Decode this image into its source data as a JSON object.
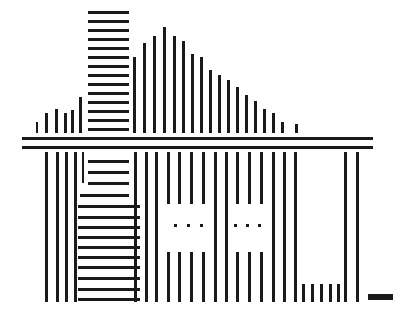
{
  "figure": {
    "width": 401,
    "height": 315,
    "background_color": "#ffffff",
    "ink_color": "#1a1a1a"
  },
  "chart_data": {
    "type": "bar",
    "xlabel": "",
    "ylabel": "",
    "grid": false,
    "legend": null,
    "groups": [
      {
        "name": "roof-left-slope",
        "orientation": "vertical",
        "description": "Ascending vertical bars forming the left roof slope",
        "bars": [
          {
            "x": 36,
            "y": 122,
            "w": 2,
            "h": 11
          },
          {
            "x": 45,
            "y": 113,
            "w": 3,
            "h": 20
          },
          {
            "x": 55,
            "y": 109,
            "w": 3,
            "h": 24
          },
          {
            "x": 64,
            "y": 113,
            "w": 3,
            "h": 20
          },
          {
            "x": 71,
            "y": 110,
            "w": 3,
            "h": 23
          },
          {
            "x": 79,
            "y": 97,
            "w": 3,
            "h": 36
          }
        ]
      },
      {
        "name": "chimney-block",
        "orientation": "horizontal",
        "description": "Stack of horizontal bars forming the chimney / upper-left mass",
        "bars": [
          {
            "x": 88,
            "y": 11,
            "w": 41,
            "h": 3
          },
          {
            "x": 88,
            "y": 20,
            "w": 41,
            "h": 3
          },
          {
            "x": 88,
            "y": 29,
            "w": 41,
            "h": 3
          },
          {
            "x": 88,
            "y": 38,
            "w": 41,
            "h": 3
          },
          {
            "x": 88,
            "y": 47,
            "w": 41,
            "h": 3
          },
          {
            "x": 88,
            "y": 56,
            "w": 41,
            "h": 3
          },
          {
            "x": 88,
            "y": 65,
            "w": 41,
            "h": 3
          },
          {
            "x": 88,
            "y": 74,
            "w": 41,
            "h": 3
          },
          {
            "x": 88,
            "y": 83,
            "w": 41,
            "h": 3
          },
          {
            "x": 88,
            "y": 92,
            "w": 41,
            "h": 3
          },
          {
            "x": 88,
            "y": 101,
            "w": 41,
            "h": 3
          },
          {
            "x": 88,
            "y": 110,
            "w": 41,
            "h": 3
          },
          {
            "x": 88,
            "y": 119,
            "w": 41,
            "h": 3
          },
          {
            "x": 88,
            "y": 128,
            "w": 41,
            "h": 3
          }
        ]
      },
      {
        "name": "roof-ridge-and-right-slope",
        "orientation": "vertical",
        "description": "Tall bars at the ridge descending to the right eave",
        "bars": [
          {
            "x": 133,
            "y": 57,
            "w": 3,
            "h": 76
          },
          {
            "x": 143,
            "y": 43,
            "w": 3,
            "h": 90
          },
          {
            "x": 153,
            "y": 36,
            "w": 3,
            "h": 97
          },
          {
            "x": 163,
            "y": 27,
            "w": 3,
            "h": 106
          },
          {
            "x": 173,
            "y": 36,
            "w": 3,
            "h": 97
          },
          {
            "x": 182,
            "y": 41,
            "w": 3,
            "h": 92
          },
          {
            "x": 191,
            "y": 54,
            "w": 3,
            "h": 79
          },
          {
            "x": 200,
            "y": 57,
            "w": 3,
            "h": 76
          },
          {
            "x": 209,
            "y": 70,
            "w": 3,
            "h": 63
          },
          {
            "x": 218,
            "y": 75,
            "w": 3,
            "h": 58
          },
          {
            "x": 227,
            "y": 80,
            "w": 3,
            "h": 53
          },
          {
            "x": 236,
            "y": 87,
            "w": 3,
            "h": 46
          },
          {
            "x": 245,
            "y": 95,
            "w": 3,
            "h": 38
          },
          {
            "x": 254,
            "y": 101,
            "w": 3,
            "h": 32
          },
          {
            "x": 263,
            "y": 109,
            "w": 3,
            "h": 24
          },
          {
            "x": 272,
            "y": 113,
            "w": 3,
            "h": 20
          },
          {
            "x": 281,
            "y": 122,
            "w": 3,
            "h": 11
          },
          {
            "x": 295,
            "y": 124,
            "w": 3,
            "h": 9
          }
        ]
      },
      {
        "name": "ground-lines",
        "orientation": "horizontal",
        "description": "Double horizontal rule separating roof from body",
        "bars": [
          {
            "x": 22,
            "y": 137,
            "w": 351,
            "h": 3
          },
          {
            "x": 22,
            "y": 146,
            "w": 351,
            "h": 3
          }
        ]
      },
      {
        "name": "body-left-verticals",
        "orientation": "vertical",
        "description": "Vertical bars at the left wall of the body",
        "bars": [
          {
            "x": 45,
            "y": 152,
            "w": 3,
            "h": 150
          },
          {
            "x": 56,
            "y": 152,
            "w": 3,
            "h": 150
          },
          {
            "x": 65,
            "y": 152,
            "w": 3,
            "h": 150
          },
          {
            "x": 74,
            "y": 152,
            "w": 3,
            "h": 150
          },
          {
            "x": 82,
            "y": 152,
            "w": 2,
            "h": 31
          }
        ]
      },
      {
        "name": "body-horizontal-block",
        "orientation": "horizontal",
        "description": "Block of horizontal bars of growing width in the lower left body",
        "bars": [
          {
            "x": 88,
            "y": 160,
            "w": 41,
            "h": 3
          },
          {
            "x": 88,
            "y": 171,
            "w": 41,
            "h": 3
          },
          {
            "x": 88,
            "y": 182,
            "w": 41,
            "h": 3
          },
          {
            "x": 80,
            "y": 194,
            "w": 49,
            "h": 3
          },
          {
            "x": 78,
            "y": 205,
            "w": 62,
            "h": 3
          },
          {
            "x": 78,
            "y": 216,
            "w": 62,
            "h": 3
          },
          {
            "x": 78,
            "y": 226,
            "w": 62,
            "h": 3
          },
          {
            "x": 78,
            "y": 236,
            "w": 62,
            "h": 3
          },
          {
            "x": 78,
            "y": 246,
            "w": 62,
            "h": 3
          },
          {
            "x": 78,
            "y": 256,
            "w": 62,
            "h": 3
          },
          {
            "x": 78,
            "y": 266,
            "w": 62,
            "h": 3
          },
          {
            "x": 78,
            "y": 277,
            "w": 62,
            "h": 3
          },
          {
            "x": 78,
            "y": 288,
            "w": 62,
            "h": 3
          },
          {
            "x": 78,
            "y": 298,
            "w": 62,
            "h": 3
          }
        ]
      },
      {
        "name": "body-mid-verticals",
        "orientation": "vertical",
        "description": "Full-height vertical bars framing the window regions",
        "bars": [
          {
            "x": 134,
            "y": 152,
            "w": 3,
            "h": 150
          },
          {
            "x": 145,
            "y": 152,
            "w": 3,
            "h": 150
          },
          {
            "x": 155,
            "y": 152,
            "w": 3,
            "h": 150
          },
          {
            "x": 214,
            "y": 152,
            "w": 3,
            "h": 150
          },
          {
            "x": 225,
            "y": 152,
            "w": 3,
            "h": 150
          },
          {
            "x": 272,
            "y": 152,
            "w": 3,
            "h": 150
          },
          {
            "x": 283,
            "y": 152,
            "w": 3,
            "h": 150
          },
          {
            "x": 294,
            "y": 152,
            "w": 3,
            "h": 150
          },
          {
            "x": 344,
            "y": 152,
            "w": 3,
            "h": 150
          },
          {
            "x": 356,
            "y": 152,
            "w": 3,
            "h": 150
          }
        ]
      },
      {
        "name": "window-left-top-bars",
        "orientation": "vertical",
        "description": "Short bars above the left window opening",
        "bars": [
          {
            "x": 167,
            "y": 152,
            "w": 3,
            "h": 52
          },
          {
            "x": 178,
            "y": 152,
            "w": 3,
            "h": 52
          },
          {
            "x": 190,
            "y": 152,
            "w": 3,
            "h": 52
          },
          {
            "x": 202,
            "y": 152,
            "w": 3,
            "h": 52
          }
        ]
      },
      {
        "name": "window-left-bottom-bars",
        "orientation": "vertical",
        "description": "Short bars below the left window opening",
        "bars": [
          {
            "x": 167,
            "y": 252,
            "w": 3,
            "h": 50
          },
          {
            "x": 178,
            "y": 252,
            "w": 3,
            "h": 50
          },
          {
            "x": 190,
            "y": 252,
            "w": 3,
            "h": 50
          },
          {
            "x": 202,
            "y": 252,
            "w": 3,
            "h": 50
          }
        ]
      },
      {
        "name": "window-left-dots",
        "orientation": "dot",
        "description": "Three dots inside the left window opening",
        "bars": [
          {
            "x": 174,
            "y": 224,
            "w": 3,
            "h": 3
          },
          {
            "x": 187,
            "y": 224,
            "w": 3,
            "h": 3
          },
          {
            "x": 200,
            "y": 224,
            "w": 3,
            "h": 3
          }
        ]
      },
      {
        "name": "window-right-top-bars",
        "orientation": "vertical",
        "description": "Short bars above the right window opening",
        "bars": [
          {
            "x": 236,
            "y": 152,
            "w": 3,
            "h": 52
          },
          {
            "x": 248,
            "y": 152,
            "w": 3,
            "h": 52
          },
          {
            "x": 260,
            "y": 152,
            "w": 3,
            "h": 52
          }
        ]
      },
      {
        "name": "window-right-bottom-bars",
        "orientation": "vertical",
        "description": "Short bars below the right window opening",
        "bars": [
          {
            "x": 236,
            "y": 252,
            "w": 3,
            "h": 50
          },
          {
            "x": 248,
            "y": 252,
            "w": 3,
            "h": 50
          },
          {
            "x": 260,
            "y": 252,
            "w": 3,
            "h": 50
          }
        ]
      },
      {
        "name": "window-right-dots",
        "orientation": "dot",
        "description": "Three dots inside the right window opening",
        "bars": [
          {
            "x": 234,
            "y": 224,
            "w": 3,
            "h": 3
          },
          {
            "x": 246,
            "y": 224,
            "w": 3,
            "h": 3
          },
          {
            "x": 258,
            "y": 224,
            "w": 3,
            "h": 3
          }
        ]
      },
      {
        "name": "door-bottom-bars",
        "orientation": "vertical",
        "description": "Row of short vertical bars at the bottom of the right door panel",
        "bars": [
          {
            "x": 302,
            "y": 284,
            "w": 3,
            "h": 18
          },
          {
            "x": 311,
            "y": 284,
            "w": 3,
            "h": 18
          },
          {
            "x": 320,
            "y": 284,
            "w": 3,
            "h": 18
          },
          {
            "x": 329,
            "y": 284,
            "w": 3,
            "h": 18
          },
          {
            "x": 337,
            "y": 284,
            "w": 3,
            "h": 18
          }
        ]
      },
      {
        "name": "baseline-dash",
        "orientation": "horizontal",
        "description": "Small isolated horizontal dash at the bottom right",
        "bars": [
          {
            "x": 368,
            "y": 294,
            "w": 25,
            "h": 6
          }
        ]
      }
    ]
  }
}
